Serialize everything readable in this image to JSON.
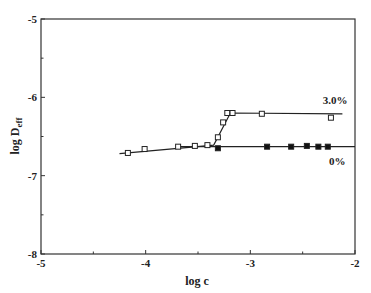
{
  "chart_data": {
    "type": "line",
    "title": "",
    "xlabel": "log c",
    "ylabel": "log D",
    "ylabel_subscript": "eff",
    "xlim": [
      -5,
      -2
    ],
    "ylim": [
      -8,
      -5
    ],
    "x_ticks": [
      -5,
      -4,
      -3,
      -2
    ],
    "x_tick_labels": [
      "-5",
      "-4",
      "-3",
      "-2"
    ],
    "y_ticks": [
      -5,
      -6,
      -7,
      -8
    ],
    "y_tick_labels": [
      "-5",
      "-6",
      "-7",
      "-8"
    ],
    "grid": false,
    "legend": "inline labels",
    "series": [
      {
        "name": "3.0%",
        "marker": "open-square",
        "points": [
          [
            -4.17,
            -6.71
          ],
          [
            -4.01,
            -6.66
          ],
          [
            -3.69,
            -6.63
          ],
          [
            -3.53,
            -6.62
          ],
          [
            -3.41,
            -6.61
          ],
          [
            -3.31,
            -6.51
          ],
          [
            -3.26,
            -6.32
          ],
          [
            -3.22,
            -6.2
          ],
          [
            -3.17,
            -6.2
          ],
          [
            -2.89,
            -6.21
          ],
          [
            -2.23,
            -6.26
          ]
        ],
        "fit_line": [
          [
            -4.25,
            -6.72
          ],
          [
            -3.35,
            -6.61
          ],
          [
            -3.19,
            -6.2
          ],
          [
            -2.12,
            -6.21
          ]
        ]
      },
      {
        "name": "0%",
        "marker": "filled-square",
        "points": [
          [
            -3.31,
            -6.65
          ],
          [
            -2.84,
            -6.63
          ],
          [
            -2.61,
            -6.63
          ],
          [
            -2.46,
            -6.62
          ],
          [
            -2.35,
            -6.63
          ],
          [
            -2.26,
            -6.63
          ]
        ],
        "fit_line": [
          [
            -3.7,
            -6.63
          ],
          [
            -2.0,
            -6.63
          ]
        ]
      }
    ],
    "annotations": [
      {
        "text": "3.0%",
        "x": -2.19,
        "y": -6.09
      },
      {
        "text": "0%",
        "x": -2.17,
        "y": -6.87
      }
    ]
  }
}
